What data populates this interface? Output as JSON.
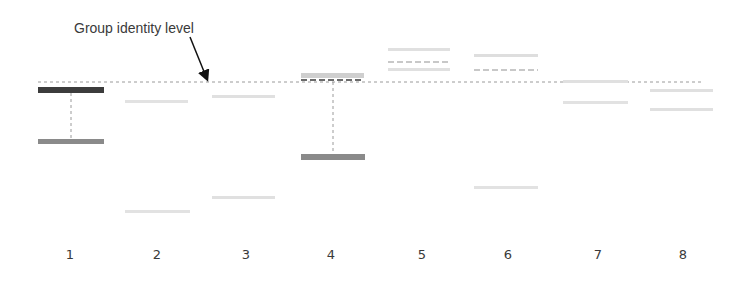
{
  "annotation": {
    "label": "Group identity level",
    "arrow_from": [
      190,
      37
    ],
    "arrow_to": [
      207,
      83
    ]
  },
  "reference_line": {
    "y": 82,
    "x_start": 38,
    "x_end": 703,
    "color": "#9a9a9a"
  },
  "lanes": [
    {
      "label": "1",
      "label_x": 70,
      "bars": [
        {
          "x": 38,
          "y": 87,
          "w": 66,
          "h": 6,
          "color": "#3c3c3c"
        },
        {
          "x": 38,
          "y": 139,
          "w": 66,
          "h": 5,
          "color": "#8a8a8a"
        }
      ],
      "connector": {
        "x": 71,
        "y1": 93,
        "y2": 139
      }
    },
    {
      "label": "2",
      "label_x": 157,
      "bars": [
        {
          "x": 125,
          "y": 100,
          "w": 63,
          "h": 3,
          "color": "#e2e2e2"
        },
        {
          "x": 125,
          "y": 210,
          "w": 65,
          "h": 3,
          "color": "#e2e2e2"
        }
      ]
    },
    {
      "label": "3",
      "label_x": 246,
      "bars": [
        {
          "x": 212,
          "y": 95,
          "w": 63,
          "h": 3,
          "color": "#e0e0e0"
        },
        {
          "x": 212,
          "y": 196,
          "w": 63,
          "h": 3,
          "color": "#e0e0e0"
        }
      ]
    },
    {
      "label": "4",
      "label_x": 331,
      "bars": [
        {
          "x": 301,
          "y": 73,
          "w": 63,
          "h": 5,
          "color": "#cfcfcf"
        },
        {
          "x": 301,
          "y": 154,
          "w": 64,
          "h": 6,
          "color": "#8a8a8a"
        }
      ],
      "dashes": [
        {
          "x": 301,
          "y": 80,
          "w": 63,
          "color": "#6a6a6a"
        }
      ],
      "connector": {
        "x": 333,
        "y1": 82,
        "y2": 154
      }
    },
    {
      "label": "5",
      "label_x": 422,
      "bars": [
        {
          "x": 388,
          "y": 48,
          "w": 62,
          "h": 3,
          "color": "#e0e0e0"
        },
        {
          "x": 388,
          "y": 68,
          "w": 62,
          "h": 3,
          "color": "#e0e0e0"
        }
      ],
      "dashes": [
        {
          "x": 388,
          "y": 62,
          "w": 62,
          "color": "#c8c8c8"
        }
      ]
    },
    {
      "label": "6",
      "label_x": 508,
      "bars": [
        {
          "x": 474,
          "y": 54,
          "w": 64,
          "h": 3,
          "color": "#dedede"
        },
        {
          "x": 474,
          "y": 186,
          "w": 64,
          "h": 3,
          "color": "#e2e2e2"
        }
      ],
      "dashes": [
        {
          "x": 474,
          "y": 70,
          "w": 64,
          "color": "#c8c8c8"
        }
      ]
    },
    {
      "label": "7",
      "label_x": 598,
      "bars": [
        {
          "x": 563,
          "y": 80,
          "w": 65,
          "h": 3,
          "color": "#e0e0e0"
        },
        {
          "x": 563,
          "y": 101,
          "w": 65,
          "h": 3,
          "color": "#e2e2e2"
        }
      ]
    },
    {
      "label": "8",
      "label_x": 683,
      "bars": [
        {
          "x": 650,
          "y": 89,
          "w": 63,
          "h": 3,
          "color": "#e0e0e0"
        },
        {
          "x": 650,
          "y": 108,
          "w": 63,
          "h": 3,
          "color": "#e0e0e0"
        }
      ]
    }
  ]
}
